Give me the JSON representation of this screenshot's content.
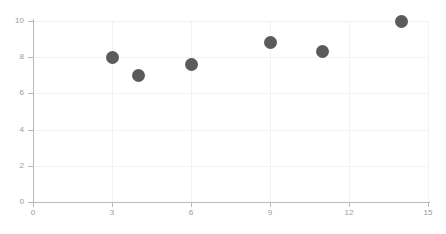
{
  "chart_data": {
    "type": "scatter",
    "title": "",
    "subtitle": "",
    "xlabel": "",
    "ylabel": "",
    "xlim": [
      0,
      15
    ],
    "ylim": [
      0,
      10
    ],
    "x_ticks": [
      0,
      3,
      6,
      9,
      12,
      15
    ],
    "y_ticks": [
      0,
      2,
      4,
      6,
      8,
      10
    ],
    "x_tick_labels": [
      "0",
      "3",
      "6",
      "9",
      "12",
      "15"
    ],
    "y_tick_labels": [
      "0",
      "2",
      "4",
      "6",
      "8",
      "10"
    ],
    "grid": true,
    "legend": false,
    "legend_position": "none",
    "marker_color": "#5b5b5b",
    "grid_color": "#f2f2f2",
    "axis_color": "#b9b9b9",
    "tick_label_color": "#9a9a9a",
    "background_color": "#ffffff",
    "series": [
      {
        "name": "series-1",
        "points": [
          {
            "x": 3,
            "y": 8.0
          },
          {
            "x": 4,
            "y": 7.0
          },
          {
            "x": 6,
            "y": 7.6
          },
          {
            "x": 9,
            "y": 8.8
          },
          {
            "x": 11,
            "y": 8.3
          },
          {
            "x": 14,
            "y": 10.0
          }
        ]
      }
    ]
  }
}
